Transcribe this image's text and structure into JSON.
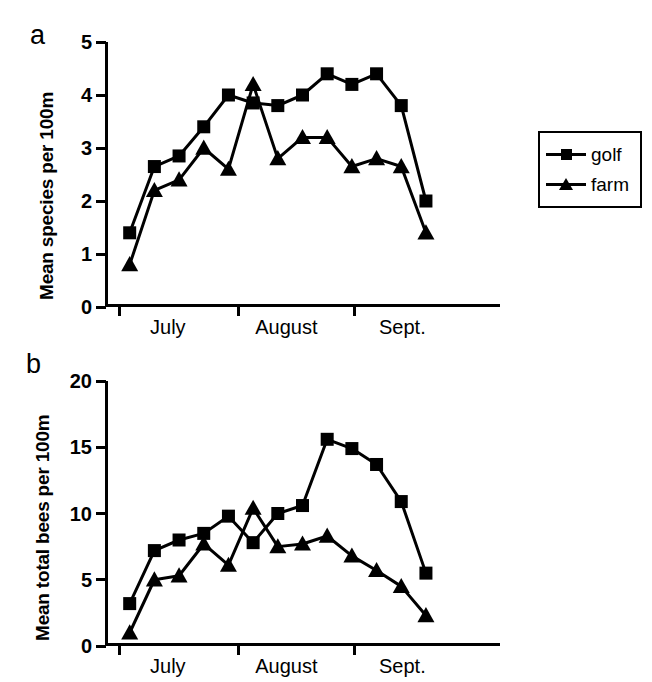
{
  "figure": {
    "panels": [
      {
        "id": "a",
        "label": "a",
        "ylabel": "Mean species per 100m"
      },
      {
        "id": "b",
        "label": "b",
        "ylabel": "Mean total bees per 100m"
      }
    ],
    "legend": {
      "golf_label": "golf",
      "farm_label": "farm",
      "golf_marker": "square-marker-icon",
      "farm_marker": "triangle-marker-icon"
    }
  },
  "chart_data": [
    {
      "type": "line",
      "panel": "a",
      "title": "",
      "xlabel": "",
      "ylabel": "Mean species per 100m",
      "ylim": [
        0,
        5
      ],
      "yticks": [
        0,
        1,
        2,
        3,
        4,
        5
      ],
      "ytick_labels": [
        "0",
        "1",
        "2",
        "3",
        "4",
        "5"
      ],
      "xlim": [
        0,
        16
      ],
      "xticks": [
        0.6,
        5.4,
        10.1
      ],
      "xtick_labels": [
        "July",
        "August",
        "Sept."
      ],
      "grid": false,
      "legend_position": "right-outside",
      "x": [
        1,
        2,
        3,
        4,
        5,
        6,
        7,
        8,
        9,
        10,
        11,
        12,
        13,
        14,
        15,
        16
      ],
      "series": [
        {
          "name": "golf",
          "marker": "square",
          "values": [
            1.4,
            2.65,
            2.85,
            3.4,
            4.0,
            3.85,
            3.8,
            4.0,
            4.4,
            4.2,
            4.4,
            3.8,
            2.0
          ]
        },
        {
          "name": "farm",
          "marker": "triangle",
          "values": [
            0.8,
            2.2,
            2.4,
            3.0,
            2.6,
            4.2,
            2.8,
            3.2,
            3.2,
            2.65,
            2.8,
            2.65,
            1.4
          ]
        }
      ]
    },
    {
      "type": "line",
      "panel": "b",
      "title": "",
      "xlabel": "",
      "ylabel": "Mean total bees per 100m",
      "ylim": [
        0,
        20
      ],
      "yticks": [
        0,
        5,
        10,
        15,
        20
      ],
      "ytick_labels": [
        "0",
        "5",
        "10",
        "15",
        "20"
      ],
      "xlim": [
        0,
        16
      ],
      "xticks": [
        0.6,
        5.4,
        10.1
      ],
      "xtick_labels": [
        "July",
        "August",
        "Sept."
      ],
      "grid": false,
      "legend_position": "right-outside",
      "x": [
        1,
        2,
        3,
        4,
        5,
        6,
        7,
        8,
        9,
        10,
        11,
        12,
        13,
        14,
        15,
        16
      ],
      "series": [
        {
          "name": "golf",
          "marker": "square",
          "values": [
            3.2,
            7.2,
            8.0,
            8.5,
            9.8,
            7.8,
            10.0,
            10.6,
            15.6,
            14.9,
            13.7,
            10.9,
            5.5
          ]
        },
        {
          "name": "farm",
          "marker": "triangle",
          "values": [
            1.0,
            5.0,
            5.3,
            7.7,
            6.1,
            10.4,
            7.5,
            7.7,
            8.3,
            6.8,
            5.7,
            4.5,
            2.3
          ]
        }
      ]
    }
  ]
}
